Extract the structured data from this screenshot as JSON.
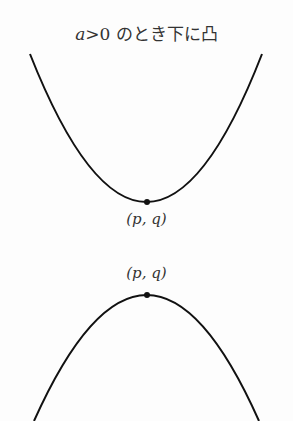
{
  "title": {
    "var": "a",
    "rest": ">0 のとき下に凸"
  },
  "upper": {
    "vertex_label": "(p, q)"
  },
  "lower": {
    "vertex_label": "(p, q)"
  }
}
